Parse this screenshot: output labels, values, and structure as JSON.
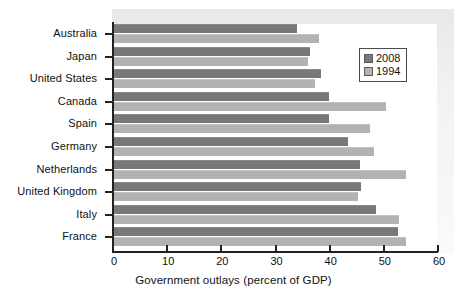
{
  "figure": {
    "clipped_top_caption": "",
    "axis_title_x": "Government outlays (percent of GDP)"
  },
  "legend": {
    "position": "top-right-inside",
    "entries": [
      {
        "label": "2008",
        "color": "#787878",
        "key": "v2008"
      },
      {
        "label": "1994",
        "color": "#b2b2b2",
        "key": "v1994"
      }
    ]
  },
  "axis": {
    "x_ticks": [
      "0",
      "10",
      "20",
      "30",
      "40",
      "50",
      "60"
    ],
    "x_min": 0,
    "x_max": 60,
    "x_step": 10
  },
  "chart_data": {
    "type": "bar",
    "orientation": "horizontal",
    "title": "",
    "xlabel": "Government outlays (percent of GDP)",
    "ylabel": "",
    "xlim": [
      0,
      60
    ],
    "xticks": [
      0,
      10,
      20,
      30,
      40,
      50,
      60
    ],
    "grid": false,
    "legend_position": "upper right",
    "categories": [
      "Australia",
      "Japan",
      "United States",
      "Canada",
      "Spain",
      "Germany",
      "Netherlands",
      "United Kingdom",
      "Italy",
      "France"
    ],
    "series": [
      {
        "name": "2008",
        "color": "#787878",
        "values": [
          34.0,
          36.4,
          38.4,
          39.8,
          39.8,
          43.4,
          45.6,
          45.8,
          48.6,
          52.6
        ]
      },
      {
        "name": "1994",
        "color": "#b2b2b2",
        "values": [
          38.0,
          36.0,
          37.2,
          50.4,
          47.4,
          48.2,
          54.0,
          45.2,
          52.8,
          54.0
        ]
      }
    ]
  }
}
